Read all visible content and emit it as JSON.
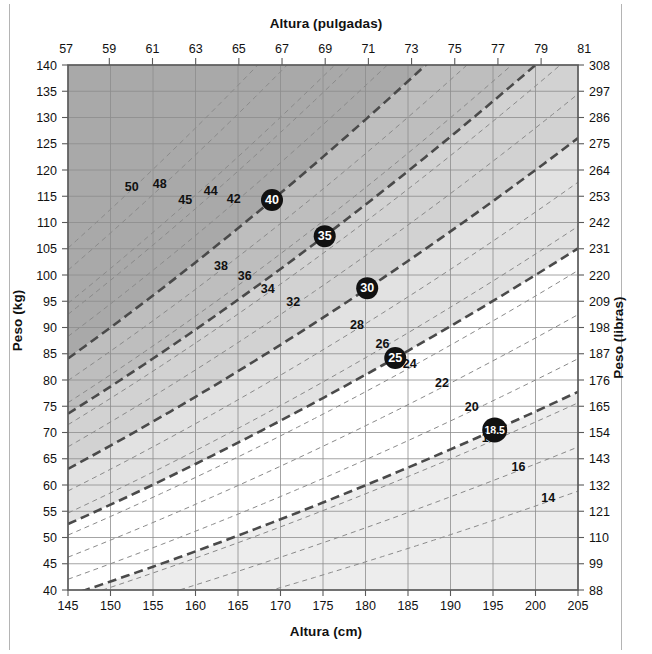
{
  "titles": {
    "top": "Altura (pulgadas)",
    "bottom": "Altura (cm)",
    "left": "Peso (kg)",
    "right": "Peso (libras)"
  },
  "chart_data": {
    "type": "line",
    "title": "",
    "xlabel": "Altura (cm)",
    "ylabel": "Peso (kg)",
    "xlabel_secondary": "Altura (pulgadas)",
    "ylabel_secondary": "Peso (libras)",
    "grid": true,
    "legend": "none",
    "xlim": [
      145,
      205
    ],
    "ylim": [
      40,
      140
    ],
    "xlim_secondary": [
      57.086,
      80.708
    ],
    "ylim_secondary": [
      88,
      308
    ],
    "x_ticks_cm": [
      145,
      150,
      155,
      160,
      165,
      170,
      175,
      180,
      185,
      190,
      195,
      200,
      205
    ],
    "x_ticks_inches": [
      57,
      59,
      61,
      63,
      65,
      67,
      69,
      71,
      73,
      75,
      77,
      79,
      81
    ],
    "y_ticks_kg": [
      140,
      135,
      130,
      125,
      120,
      115,
      110,
      105,
      100,
      95,
      90,
      85,
      80,
      75,
      70,
      65,
      60,
      55,
      50,
      45,
      40
    ],
    "y_ticks_lb": [
      308,
      297,
      286,
      275,
      264,
      253,
      242,
      231,
      220,
      209,
      198,
      187,
      176,
      165,
      154,
      143,
      132,
      121,
      110,
      99,
      88
    ],
    "series_description": "Isopleths of constant BMI: weight = BMI * (height_m)^2",
    "bmi_lines": [
      {
        "value": 50,
        "label": "50",
        "style": "thin",
        "circled": false,
        "label_h": 152.5,
        "label_w": 116.0
      },
      {
        "value": 48,
        "label": "48",
        "style": "thin",
        "circled": false,
        "label_h": 155.8,
        "label_w": 116.5
      },
      {
        "value": 45,
        "label": "45",
        "style": "thin",
        "circled": false,
        "label_h": 158.8,
        "label_w": 113.5
      },
      {
        "value": 44,
        "label": "44",
        "style": "thin",
        "circled": false,
        "label_h": 161.8,
        "label_w": 115.2
      },
      {
        "value": 42,
        "label": "42",
        "style": "thin",
        "circled": false,
        "label_h": 164.5,
        "label_w": 113.7
      },
      {
        "value": 40,
        "label": "40",
        "style": "bold",
        "circled": true,
        "label_h": 169.0,
        "label_w": 114.3
      },
      {
        "value": 38,
        "label": "38",
        "style": "thin",
        "circled": false,
        "label_h": 163.0,
        "label_w": 101.0
      },
      {
        "value": 36,
        "label": "36",
        "style": "thin",
        "circled": false,
        "label_h": 165.8,
        "label_w": 99.0
      },
      {
        "value": 34,
        "label": "34",
        "style": "thin",
        "circled": false,
        "label_h": 168.5,
        "label_w": 96.6
      },
      {
        "value": 35,
        "label": "35",
        "style": "bold",
        "circled": true,
        "label_h": 175.2,
        "label_w": 107.4
      },
      {
        "value": 32,
        "label": "32",
        "style": "thin",
        "circled": false,
        "label_h": 171.5,
        "label_w": 94.1
      },
      {
        "value": 30,
        "label": "30",
        "style": "bold",
        "circled": true,
        "label_h": 180.2,
        "label_w": 97.5
      },
      {
        "value": 28,
        "label": "28",
        "style": "thin",
        "circled": false,
        "label_h": 179.0,
        "label_w": 89.7
      },
      {
        "value": 26,
        "label": "26",
        "style": "thin",
        "circled": false,
        "label_h": 182.0,
        "label_w": 86.1
      },
      {
        "value": 24,
        "label": "24",
        "style": "thin",
        "circled": false,
        "label_h": 185.2,
        "label_w": 82.3
      },
      {
        "value": 22,
        "label": "22",
        "style": "thin",
        "circled": false,
        "label_h": 189.0,
        "label_w": 78.6
      },
      {
        "value": 25,
        "label": "25",
        "style": "bold",
        "circled": true,
        "label_h": 183.5,
        "label_w": 84.2
      },
      {
        "value": 20,
        "label": "20",
        "style": "thin",
        "circled": false,
        "label_h": 192.5,
        "label_w": 74.1
      },
      {
        "value": 18.5,
        "label": "18.5",
        "style": "bold",
        "circled": true,
        "label_h": 195.2,
        "label_w": 70.5
      },
      {
        "value": 18,
        "label": "18",
        "style": "thin",
        "circled": false,
        "label_h": 194.5,
        "label_w": 68.1
      },
      {
        "value": 16,
        "label": "16",
        "style": "thin",
        "circled": false,
        "label_h": 198.0,
        "label_w": 62.7
      },
      {
        "value": 14,
        "label": "14",
        "style": "thin",
        "circled": false,
        "label_h": 201.5,
        "label_w": 56.8
      }
    ],
    "bands": [
      {
        "name": "underweight",
        "bmi_min": 0,
        "bmi_max": 18.5,
        "color": "#ededed"
      },
      {
        "name": "normal",
        "bmi_min": 18.5,
        "bmi_max": 25,
        "color": "#ffffff"
      },
      {
        "name": "overweight",
        "bmi_min": 25,
        "bmi_max": 30,
        "color": "#e2e2e2"
      },
      {
        "name": "obesity-i",
        "bmi_min": 30,
        "bmi_max": 35,
        "color": "#d2d2d2"
      },
      {
        "name": "obesity-ii",
        "bmi_min": 35,
        "bmi_max": 40,
        "color": "#bebebe"
      },
      {
        "name": "obesity-iii",
        "bmi_min": 40,
        "bmi_max": 999,
        "color": "#a9a9a9"
      }
    ]
  },
  "colors": {
    "axis": "#5a5a5a",
    "grid": "#8d8d8d",
    "bmi_line_thin": "#8a8a8a",
    "bmi_line_bold": "#4a4a4a",
    "marker_fill": "#111111",
    "marker_text": "#ffffff",
    "text": "#111111",
    "frame": "#b4b4b4"
  }
}
